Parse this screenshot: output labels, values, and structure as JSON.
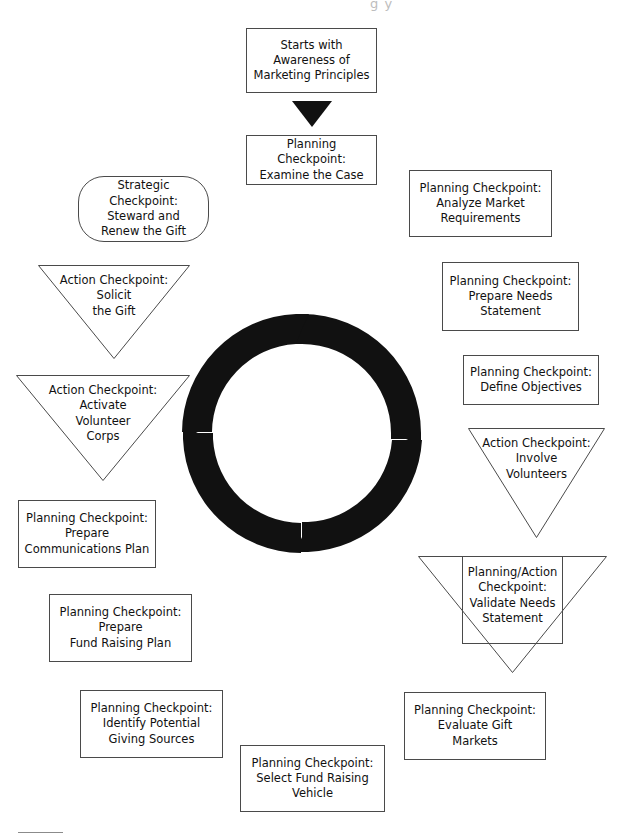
{
  "diagram": {
    "title_fragment": "g y",
    "background_color": "#ffffff",
    "line_color": "#4a4a4a",
    "cycle_color": "#111111",
    "text_color": "#111111"
  },
  "nodes": [
    {
      "id": "starts-with-awareness",
      "shape": "rectangle",
      "label": "Starts with\nAwareness of\nMarketing Principles",
      "x": 246,
      "y": 28,
      "w": 131,
      "h": 65,
      "font_size": 11.5
    },
    {
      "id": "examine-the-case",
      "shape": "rectangle",
      "label": "Planning Checkpoint:\nExamine the Case",
      "x": 246,
      "y": 135,
      "w": 131,
      "h": 50,
      "font_size": 11.5
    },
    {
      "id": "analyze-market-requirements",
      "shape": "rectangle",
      "label": "Planning Checkpoint:\nAnalyze Market\nRequirements",
      "x": 409,
      "y": 170,
      "w": 143,
      "h": 67,
      "font_size": 11.5
    },
    {
      "id": "prepare-needs-statement",
      "shape": "rectangle",
      "label": "Planning Checkpoint:\nPrepare Needs\nStatement",
      "x": 442,
      "y": 262,
      "w": 137,
      "h": 69,
      "font_size": 11.5
    },
    {
      "id": "define-objectives",
      "shape": "rectangle",
      "label": "Planning Checkpoint:\nDefine Objectives",
      "x": 463,
      "y": 355,
      "w": 136,
      "h": 50,
      "font_size": 11.5
    },
    {
      "id": "involve-volunteers",
      "shape": "triangle",
      "label": "Action Checkpoint:\nInvolve\nVolunteers",
      "x": 468,
      "y": 428,
      "w": 137,
      "h": 110,
      "font_size": 11.5
    },
    {
      "id": "validate-needs-statement",
      "shape": "triangle-rectangle",
      "label": "Planning/Action\nCheckpoint:\nValidate Needs\nStatement",
      "x": 418,
      "y": 556,
      "w": 189,
      "h": 117,
      "inner_x": 462,
      "inner_y": 556,
      "inner_w": 100,
      "inner_h": 87,
      "font_size": 11.5
    },
    {
      "id": "evaluate-gift-markets",
      "shape": "rectangle",
      "label": "Planning Checkpoint:\nEvaluate Gift\nMarkets",
      "x": 404,
      "y": 692,
      "w": 142,
      "h": 68,
      "font_size": 11.5
    },
    {
      "id": "select-fund-raising-vehicle",
      "shape": "rectangle",
      "label": "Planning Checkpoint:\nSelect Fund Raising\nVehicle",
      "x": 240,
      "y": 745,
      "w": 145,
      "h": 67,
      "font_size": 11.5
    },
    {
      "id": "identify-potential-giving-sources",
      "shape": "rectangle",
      "label": "Planning Checkpoint:\nIdentify Potential\nGiving Sources",
      "x": 80,
      "y": 690,
      "w": 143,
      "h": 68,
      "font_size": 11.5
    },
    {
      "id": "prepare-fund-raising-plan",
      "shape": "rectangle",
      "label": "Planning Checkpoint:\nPrepare\nFund Raising Plan",
      "x": 49,
      "y": 594,
      "w": 143,
      "h": 68,
      "font_size": 11.5
    },
    {
      "id": "prepare-communications-plan",
      "shape": "rectangle",
      "label": "Planning Checkpoint:\nPrepare\nCommunications Plan",
      "x": 18,
      "y": 500,
      "w": 138,
      "h": 68,
      "font_size": 11.5
    },
    {
      "id": "activate-volunteer-corps",
      "shape": "triangle",
      "label": "Action Checkpoint:\nActivate\nVolunteer\nCorps",
      "x": 16,
      "y": 375,
      "w": 174,
      "h": 106,
      "font_size": 11.5
    },
    {
      "id": "solicit-the-gift",
      "shape": "triangle",
      "label": "Action Checkpoint:\nSolicit\nthe Gift",
      "x": 38,
      "y": 265,
      "w": 152,
      "h": 94,
      "font_size": 11.5
    },
    {
      "id": "steward-and-renew-the-gift",
      "shape": "rounded-rectangle",
      "label": "Strategic Checkpoint:\nSteward and\nRenew the Gift",
      "x": 78,
      "y": 176,
      "w": 131,
      "h": 66,
      "font_size": 11.5
    }
  ],
  "cycle": {
    "id": "central-cycle",
    "description": "four clockwise arrow arcs forming a ring",
    "cx": 302,
    "cy": 433,
    "outer_r": 119,
    "inner_r": 89,
    "segment_count": 4,
    "direction": "clockwise",
    "color": "#111111"
  },
  "connectors": [
    {
      "id": "arrow-awareness-to-examine",
      "type": "down-triangle-arrow",
      "x": 292,
      "y": 101,
      "w": 40,
      "h": 26,
      "color": "#111111"
    }
  ],
  "footer": {
    "rule_x": 18,
    "rule_y": 832,
    "rule_w": 45
  }
}
